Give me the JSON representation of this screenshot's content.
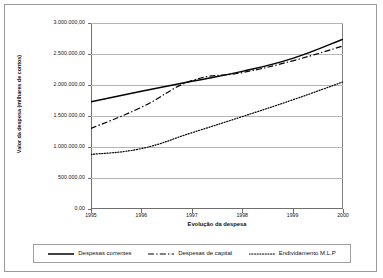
{
  "chart_data": {
    "type": "line",
    "title": "",
    "xlabel": "Evolução da despesa",
    "ylabel": "Valor da despesa (milhares de contos)",
    "x": [
      1995,
      1996,
      1997,
      1998,
      1999,
      2000
    ],
    "xtick_labels": [
      "1995",
      "1996",
      "1997",
      "1998",
      "1999",
      "2000"
    ],
    "ytick_labels": [
      "0,00",
      "500.000,00",
      "1.000.000,00",
      "1.500.000,00",
      "2.000.000,00",
      "2.500.000,00",
      "3.000.000,00"
    ],
    "ytick_values": [
      0,
      500000,
      1000000,
      1500000,
      2000000,
      2500000,
      3000000
    ],
    "ylim": [
      0,
      3000000
    ],
    "xlim": [
      1995,
      2000
    ],
    "grid": "horizontal",
    "legend_position": "bottom",
    "series": [
      {
        "name": "Despesas correntes",
        "style": "solid",
        "color": "#000000",
        "values": [
          1730000,
          1900000,
          2060000,
          2220000,
          2430000,
          2740000
        ]
      },
      {
        "name": "Despesas de capital",
        "style": "dash-dot",
        "color": "#000000",
        "values": [
          1300000,
          1640000,
          2070000,
          2200000,
          2390000,
          2630000
        ]
      },
      {
        "name": "Endividamento M.L.P",
        "style": "dotted",
        "color": "#000000",
        "values": [
          880000,
          975000,
          1230000,
          1490000,
          1760000,
          2050000
        ]
      }
    ]
  },
  "legend": {
    "items": [
      {
        "label": "Despesas correntes",
        "style": "solid"
      },
      {
        "label": "Despesas de capital",
        "style": "dash-dot"
      },
      {
        "label": "Endividamento M.L.P",
        "style": "dotted"
      }
    ]
  }
}
